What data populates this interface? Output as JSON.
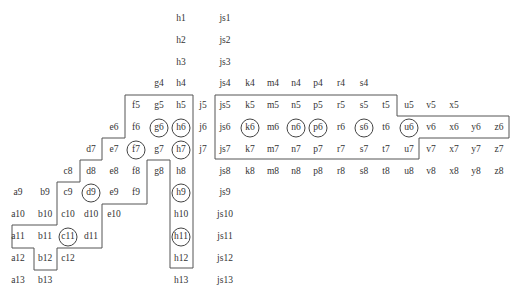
{
  "diagram": {
    "type": "grid-region-map",
    "columns": {
      "a": 18,
      "b": 45,
      "c": 68,
      "d": 91,
      "e": 114,
      "f": 136,
      "g": 159,
      "h": 181,
      "j": 203,
      "js": 225,
      "k": 250,
      "m": 273,
      "n": 296,
      "p": 318,
      "r": 341,
      "s": 364,
      "t": 386,
      "u": 409,
      "v": 431,
      "x": 454,
      "y": 476,
      "z": 499
    },
    "row_y0": 19,
    "row_step": 21.8,
    "cells": [
      {
        "label": "h1",
        "col": "h",
        "row": 1
      },
      {
        "label": "js1",
        "col": "js",
        "row": 1
      },
      {
        "label": "h2",
        "col": "h",
        "row": 2
      },
      {
        "label": "js2",
        "col": "js",
        "row": 2
      },
      {
        "label": "h3",
        "col": "h",
        "row": 3
      },
      {
        "label": "js3",
        "col": "js",
        "row": 3
      },
      {
        "label": "g4",
        "col": "g",
        "row": 4
      },
      {
        "label": "h4",
        "col": "h",
        "row": 4
      },
      {
        "label": "js4",
        "col": "js",
        "row": 4
      },
      {
        "label": "k4",
        "col": "k",
        "row": 4
      },
      {
        "label": "m4",
        "col": "m",
        "row": 4
      },
      {
        "label": "n4",
        "col": "n",
        "row": 4
      },
      {
        "label": "p4",
        "col": "p",
        "row": 4
      },
      {
        "label": "r4",
        "col": "r",
        "row": 4
      },
      {
        "label": "s4",
        "col": "s",
        "row": 4
      },
      {
        "label": "f5",
        "col": "f",
        "row": 5
      },
      {
        "label": "g5",
        "col": "g",
        "row": 5
      },
      {
        "label": "h5",
        "col": "h",
        "row": 5
      },
      {
        "label": "j5",
        "col": "j",
        "row": 5
      },
      {
        "label": "js5",
        "col": "js",
        "row": 5
      },
      {
        "label": "k5",
        "col": "k",
        "row": 5
      },
      {
        "label": "m5",
        "col": "m",
        "row": 5
      },
      {
        "label": "n5",
        "col": "n",
        "row": 5
      },
      {
        "label": "p5",
        "col": "p",
        "row": 5
      },
      {
        "label": "r5",
        "col": "r",
        "row": 5
      },
      {
        "label": "s5",
        "col": "s",
        "row": 5
      },
      {
        "label": "t5",
        "col": "t",
        "row": 5
      },
      {
        "label": "u5",
        "col": "u",
        "row": 5
      },
      {
        "label": "v5",
        "col": "v",
        "row": 5
      },
      {
        "label": "x5",
        "col": "x",
        "row": 5
      },
      {
        "label": "e6",
        "col": "e",
        "row": 6
      },
      {
        "label": "f6",
        "col": "f",
        "row": 6
      },
      {
        "label": "g6",
        "col": "g",
        "row": 6,
        "circled": true
      },
      {
        "label": "h6",
        "col": "h",
        "row": 6,
        "circled": true
      },
      {
        "label": "j6",
        "col": "j",
        "row": 6
      },
      {
        "label": "js6",
        "col": "js",
        "row": 6
      },
      {
        "label": "k6",
        "col": "k",
        "row": 6,
        "circled": true
      },
      {
        "label": "m6",
        "col": "m",
        "row": 6
      },
      {
        "label": "n6",
        "col": "n",
        "row": 6,
        "circled": true
      },
      {
        "label": "p6",
        "col": "p",
        "row": 6,
        "circled": true
      },
      {
        "label": "r6",
        "col": "r",
        "row": 6
      },
      {
        "label": "s6",
        "col": "s",
        "row": 6,
        "circled": true
      },
      {
        "label": "t6",
        "col": "t",
        "row": 6
      },
      {
        "label": "u6",
        "col": "u",
        "row": 6,
        "circled": true
      },
      {
        "label": "v6",
        "col": "v",
        "row": 6
      },
      {
        "label": "x6",
        "col": "x",
        "row": 6
      },
      {
        "label": "y6",
        "col": "y",
        "row": 6
      },
      {
        "label": "z6",
        "col": "z",
        "row": 6
      },
      {
        "label": "d7",
        "col": "d",
        "row": 7
      },
      {
        "label": "e7",
        "col": "e",
        "row": 7
      },
      {
        "label": "f7",
        "col": "f",
        "row": 7,
        "circled": true
      },
      {
        "label": "g7",
        "col": "g",
        "row": 7
      },
      {
        "label": "h7",
        "col": "h",
        "row": 7,
        "circled": true
      },
      {
        "label": "j7",
        "col": "j",
        "row": 7
      },
      {
        "label": "js7",
        "col": "js",
        "row": 7
      },
      {
        "label": "k7",
        "col": "k",
        "row": 7
      },
      {
        "label": "m7",
        "col": "m",
        "row": 7
      },
      {
        "label": "n7",
        "col": "n",
        "row": 7
      },
      {
        "label": "p7",
        "col": "p",
        "row": 7
      },
      {
        "label": "r7",
        "col": "r",
        "row": 7
      },
      {
        "label": "s7",
        "col": "s",
        "row": 7
      },
      {
        "label": "t7",
        "col": "t",
        "row": 7
      },
      {
        "label": "u7",
        "col": "u",
        "row": 7
      },
      {
        "label": "v7",
        "col": "v",
        "row": 7
      },
      {
        "label": "x7",
        "col": "x",
        "row": 7
      },
      {
        "label": "y7",
        "col": "y",
        "row": 7
      },
      {
        "label": "z7",
        "col": "z",
        "row": 7
      },
      {
        "label": "c8",
        "col": "c",
        "row": 8
      },
      {
        "label": "d8",
        "col": "d",
        "row": 8
      },
      {
        "label": "e8",
        "col": "e",
        "row": 8
      },
      {
        "label": "f8",
        "col": "f",
        "row": 8
      },
      {
        "label": "g8",
        "col": "g",
        "row": 8
      },
      {
        "label": "h8",
        "col": "h",
        "row": 8
      },
      {
        "label": "js8",
        "col": "js",
        "row": 8
      },
      {
        "label": "k8",
        "col": "k",
        "row": 8
      },
      {
        "label": "m8",
        "col": "m",
        "row": 8
      },
      {
        "label": "n8",
        "col": "n",
        "row": 8
      },
      {
        "label": "p8",
        "col": "p",
        "row": 8
      },
      {
        "label": "r8",
        "col": "r",
        "row": 8
      },
      {
        "label": "s8",
        "col": "s",
        "row": 8
      },
      {
        "label": "t8",
        "col": "t",
        "row": 8
      },
      {
        "label": "u8",
        "col": "u",
        "row": 8
      },
      {
        "label": "v8",
        "col": "v",
        "row": 8
      },
      {
        "label": "x8",
        "col": "x",
        "row": 8
      },
      {
        "label": "y8",
        "col": "y",
        "row": 8
      },
      {
        "label": "z8",
        "col": "z",
        "row": 8
      },
      {
        "label": "a9",
        "col": "a",
        "row": 9
      },
      {
        "label": "b9",
        "col": "b",
        "row": 9
      },
      {
        "label": "c9",
        "col": "c",
        "row": 9
      },
      {
        "label": "d9",
        "col": "d",
        "row": 9,
        "circled": true
      },
      {
        "label": "e9",
        "col": "e",
        "row": 9
      },
      {
        "label": "f9",
        "col": "f",
        "row": 9
      },
      {
        "label": "h9",
        "col": "h",
        "row": 9,
        "circled": true
      },
      {
        "label": "js9",
        "col": "js",
        "row": 9
      },
      {
        "label": "a10",
        "col": "a",
        "row": 10
      },
      {
        "label": "b10",
        "col": "b",
        "row": 10
      },
      {
        "label": "c10",
        "col": "c",
        "row": 10
      },
      {
        "label": "d10",
        "col": "d",
        "row": 10
      },
      {
        "label": "e10",
        "col": "e",
        "row": 10
      },
      {
        "label": "h10",
        "col": "h",
        "row": 10
      },
      {
        "label": "js10",
        "col": "js",
        "row": 10
      },
      {
        "label": "a11",
        "col": "a",
        "row": 11
      },
      {
        "label": "b11",
        "col": "b",
        "row": 11
      },
      {
        "label": "c11",
        "col": "c",
        "row": 11,
        "circled": true
      },
      {
        "label": "d11",
        "col": "d",
        "row": 11
      },
      {
        "label": "h11",
        "col": "h",
        "row": 11,
        "circled": true
      },
      {
        "label": "js11",
        "col": "js",
        "row": 11
      },
      {
        "label": "a12",
        "col": "a",
        "row": 12
      },
      {
        "label": "b12",
        "col": "b",
        "row": 12
      },
      {
        "label": "c12",
        "col": "c",
        "row": 12
      },
      {
        "label": "h12",
        "col": "h",
        "row": 12
      },
      {
        "label": "js12",
        "col": "js",
        "row": 12
      },
      {
        "label": "a13",
        "col": "a",
        "row": 13
      },
      {
        "label": "b13",
        "col": "b",
        "row": 13
      },
      {
        "label": "h13",
        "col": "h",
        "row": 13
      },
      {
        "label": "js13",
        "col": "js",
        "row": 13
      }
    ],
    "outlines": [
      {
        "name": "left-region",
        "points": "125,95 193,95 193,268 170,268 170,160 147,160 147,204 102,204 102,248 57,248 57,270 34,270 34,248 12,248 12,225 57,225 57,182 80,182 80,160 102,160 102,138 125,138"
      },
      {
        "name": "right-region",
        "points": "215,95 397,95 397,116 509,116 509,138 419,138 419,159 215,159"
      }
    ],
    "colors": {
      "line": "#555555",
      "text": "#333333",
      "background": "#ffffff"
    }
  }
}
